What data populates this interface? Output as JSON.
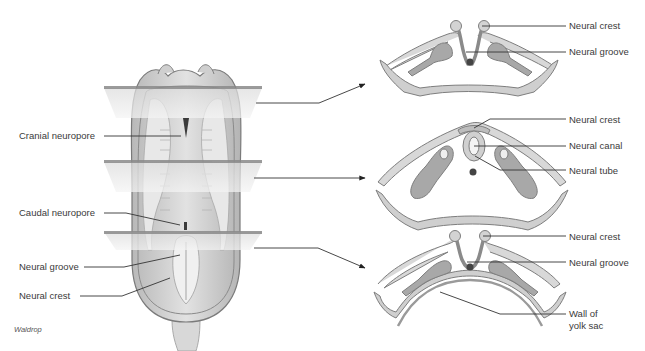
{
  "figure": {
    "credit": "Waldrop",
    "colors": {
      "tissue": "#d6d6d6",
      "tissue_dark": "#9a9a9a",
      "outline": "#7a7a7a",
      "plane": "#e6e6e6",
      "plane_edge": "#8a8a8a",
      "leader": "#333333",
      "label_text": "#3a3a3a"
    }
  },
  "embryo": {
    "labels": {
      "cranial_neuropore": "Cranial neuropore",
      "caudal_neuropore": "Caudal neuropore",
      "neural_groove": "Neural groove",
      "neural_crest": "Neural crest"
    }
  },
  "sections": [
    {
      "name": "top-section",
      "labels": [
        "Neural crest",
        "Neural groove"
      ]
    },
    {
      "name": "middle-section",
      "labels": [
        "Neural crest",
        "Neural canal",
        "Neural tube"
      ]
    },
    {
      "name": "bottom-section",
      "labels": [
        "Neural crest",
        "Neural groove",
        "Wall of",
        "yolk sac"
      ]
    }
  ]
}
